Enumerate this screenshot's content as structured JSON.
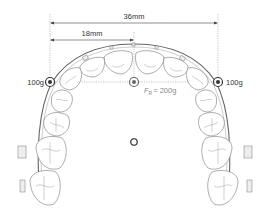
{
  "diagram": {
    "dimensions": {
      "full_width_label": "36mm",
      "half_width_label": "18mm"
    },
    "forces": {
      "left_label": "100g",
      "right_label": "100g",
      "resultant_symbol": "F",
      "resultant_subscript": "R",
      "resultant_value": "= 200g"
    },
    "colors": {
      "outline": "#777777",
      "text": "#333333",
      "resultant_text": "#888888"
    }
  }
}
